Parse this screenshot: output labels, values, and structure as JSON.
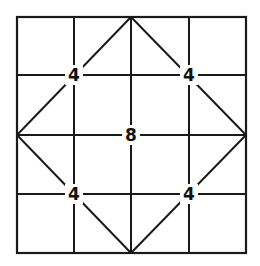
{
  "puzzle": {
    "grid": {
      "rows": 4,
      "cols": 4
    },
    "line_color": "#1a1a1a",
    "background": "#ffffff",
    "clues": [
      {
        "id": "clue-top-left",
        "value": "4",
        "row_line": 1,
        "col_line": 1
      },
      {
        "id": "clue-top-right",
        "value": "4",
        "row_line": 1,
        "col_line": 3
      },
      {
        "id": "clue-center",
        "value": "8",
        "row_line": 2,
        "col_line": 2
      },
      {
        "id": "clue-bottom-left",
        "value": "4",
        "row_line": 3,
        "col_line": 1
      },
      {
        "id": "clue-bottom-right",
        "value": "4",
        "row_line": 3,
        "col_line": 3
      }
    ],
    "diagonals": "diamond connecting midpoints of outer edges"
  }
}
